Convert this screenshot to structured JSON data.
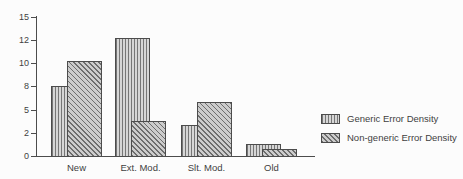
{
  "figure": {
    "background": "#fcfcfc",
    "axis_ink": "#4c4c4c",
    "text_color": "#3f3f3f"
  },
  "chart_data": {
    "type": "bar",
    "title": "",
    "categories": [
      "New",
      "Ext. Mod.",
      "Slt. Mod.",
      "Old"
    ],
    "series": [
      {
        "name": "Generic Error Density",
        "hatch": "vertical-lines",
        "fill": "#d6d6d6",
        "line": "#767676",
        "values": [
          8.0,
          12.3,
          3.0,
          1.0
        ]
      },
      {
        "name": "Non-generic Error Density",
        "hatch": "diagonal-lines",
        "fill": "#cccccc",
        "line": "#6d6d6d",
        "values": [
          10.2,
          3.5,
          6.0,
          0.6
        ]
      }
    ],
    "y_axis": {
      "tick_labels": [
        "0",
        "2",
        "5",
        "8",
        "10",
        "12",
        "15"
      ],
      "displayed_range": [
        0,
        15
      ],
      "grid": false
    },
    "x_axis": {
      "label": ""
    },
    "legend": {
      "position": "right-middle",
      "entries": [
        "Generic Error Density",
        "Non-generic Error Density"
      ]
    },
    "style_notes": {
      "bar_style": "paired bars overlap; non-generic bar drawn in front, offset right",
      "scan_look": "grayscale scanned figure"
    }
  }
}
